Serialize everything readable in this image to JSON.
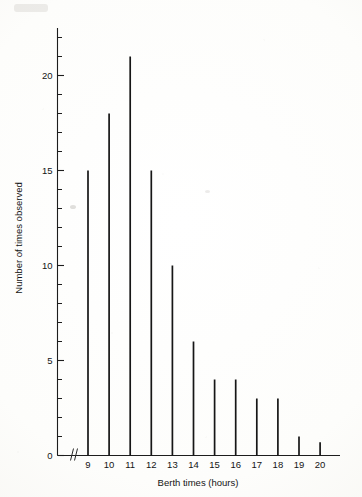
{
  "chart_data": {
    "type": "bar",
    "title": "",
    "subtitle": "",
    "xlabel": "Berth times (hours)",
    "ylabel": "Number of times observed",
    "categories": [
      "9",
      "10",
      "11",
      "12",
      "13",
      "14",
      "15",
      "16",
      "17",
      "18",
      "19",
      "20"
    ],
    "values": [
      15,
      18,
      21,
      15,
      10,
      6,
      4,
      4,
      3,
      3,
      1,
      0.7
    ],
    "xlim": [
      8.3,
      21.8
    ],
    "ylim": [
      0,
      22.5
    ],
    "x_tick_labels": [
      "9",
      "10",
      "11",
      "12",
      "13",
      "14",
      "15",
      "16",
      "17",
      "18",
      "19",
      "20"
    ],
    "y_tick_labels": [
      "0",
      "5",
      "10",
      "15",
      "20"
    ],
    "y_major_ticks": [
      0,
      5,
      10,
      15,
      20
    ],
    "y_minor_tick_step": 1,
    "grid": false,
    "legend": null,
    "legend_position": "none",
    "axis_break": {
      "axis": "x",
      "symbol": "zigzag",
      "between": [
        0,
        9
      ],
      "label": "axis-break"
    },
    "style": {
      "line_color": "#161616",
      "axis_color": "#1d1d1d",
      "background": "#fdfdfb",
      "marker": "none",
      "bar_style": "needle"
    }
  },
  "figure": {
    "width_px": 362,
    "height_px": 497
  }
}
